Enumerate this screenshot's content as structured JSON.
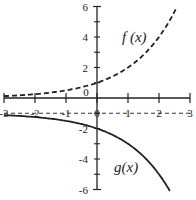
{
  "chart_data": {
    "type": "line",
    "title": "",
    "xlabel": "",
    "ylabel": "",
    "xlim": [
      -3,
      3
    ],
    "ylim": [
      -6,
      6
    ],
    "grid": false,
    "x_ticks": [
      -3,
      -2,
      -1,
      0,
      1,
      2,
      3
    ],
    "y_ticks": [
      -6,
      -4,
      -2,
      2,
      4,
      6
    ],
    "x_tick_labels": [
      "-3",
      "-2",
      "-1",
      "0",
      "1",
      "2",
      "3"
    ],
    "y_tick_labels": [
      "-6",
      "-4",
      "-2",
      "2",
      "4",
      "6"
    ],
    "origin_label": "0",
    "asymptote": {
      "y": -1,
      "style": "dashed"
    },
    "series": [
      {
        "name": "f(x)",
        "style": "dashed",
        "x": [
          -3,
          -2.5,
          -2,
          -1.5,
          -1,
          -0.5,
          0,
          0.5,
          1,
          1.5,
          2,
          2.25,
          2.5,
          2.58
        ],
        "values": [
          0.125,
          0.177,
          0.25,
          0.354,
          0.5,
          0.707,
          1,
          1.414,
          2,
          2.828,
          4,
          4.757,
          5.657,
          5.98
        ]
      },
      {
        "name": "g(x)",
        "style": "solid",
        "x": [
          -3,
          -2.5,
          -2,
          -1.5,
          -1,
          -0.5,
          0,
          0.5,
          1,
          1.5,
          2,
          2.25,
          2.35
        ],
        "values": [
          -1.125,
          -1.177,
          -1.25,
          -1.354,
          -1.5,
          -1.707,
          -2,
          -2.414,
          -3,
          -3.828,
          -5,
          -5.757,
          -6.1
        ]
      }
    ],
    "annotations": [
      {
        "text": "f(x)",
        "x": 1.15,
        "y": 4.1
      },
      {
        "text": "g(x)",
        "x": 0.85,
        "y": -4.2
      }
    ]
  },
  "labels": {
    "f": "f (x)",
    "g": "g(x)",
    "origin": "0"
  }
}
